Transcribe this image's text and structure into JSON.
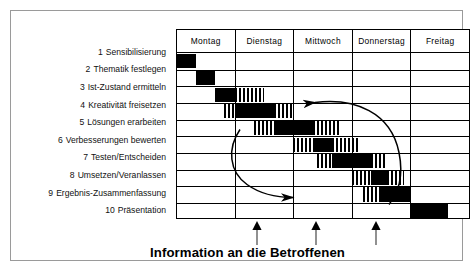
{
  "chart_data": {
    "type": "bar",
    "subtype": "gantt",
    "title": "",
    "xlabel": "",
    "ylabel": "",
    "grid": true,
    "legend": "none",
    "categories": [
      "Montag",
      "Dienstag",
      "Mittwoch",
      "Donnerstag",
      "Freitag"
    ],
    "x_unit": "day",
    "x_range": [
      0,
      5
    ],
    "tasks": [
      {
        "index": 1,
        "number": "1",
        "label": "Sensibilisierung",
        "segments": [
          {
            "style": "solid",
            "start": 0.0,
            "end": 0.33
          }
        ]
      },
      {
        "index": 2,
        "number": "2",
        "label": "Thematik festlegen",
        "segments": [
          {
            "style": "solid",
            "start": 0.33,
            "end": 0.66
          }
        ]
      },
      {
        "index": 3,
        "number": "3",
        "label": "Ist-Zustand ermitteln",
        "segments": [
          {
            "style": "solid",
            "start": 0.66,
            "end": 1.0
          },
          {
            "style": "hatch",
            "start": 1.0,
            "end": 1.5
          }
        ]
      },
      {
        "index": 4,
        "number": "4",
        "label": "Kreativität freisetzen",
        "segments": [
          {
            "style": "hatch",
            "start": 0.8,
            "end": 1.0
          },
          {
            "style": "solid",
            "start": 1.0,
            "end": 1.66
          },
          {
            "style": "hatch",
            "start": 1.66,
            "end": 2.0
          }
        ]
      },
      {
        "index": 5,
        "number": "5",
        "label": "Lösungen erarbeiten",
        "segments": [
          {
            "style": "hatch",
            "start": 1.33,
            "end": 1.66
          },
          {
            "style": "solid",
            "start": 1.66,
            "end": 2.33
          },
          {
            "style": "hatch",
            "start": 2.33,
            "end": 2.8
          }
        ]
      },
      {
        "index": 6,
        "number": "6",
        "label": "Verbesserungen bewerten",
        "segments": [
          {
            "style": "hatch",
            "start": 2.0,
            "end": 2.33
          },
          {
            "style": "solid",
            "start": 2.33,
            "end": 2.66
          },
          {
            "style": "hatch",
            "start": 2.66,
            "end": 3.1
          }
        ]
      },
      {
        "index": 7,
        "number": "7",
        "label": "Testen/Entscheiden",
        "segments": [
          {
            "style": "hatch",
            "start": 2.4,
            "end": 2.66
          },
          {
            "style": "solid",
            "start": 2.66,
            "end": 3.33
          },
          {
            "style": "hatch",
            "start": 3.33,
            "end": 3.6
          }
        ]
      },
      {
        "index": 8,
        "number": "8",
        "label": "Umsetzen/Veranlassen",
        "segments": [
          {
            "style": "hatch",
            "start": 3.0,
            "end": 3.33
          },
          {
            "style": "solid",
            "start": 3.33,
            "end": 3.6
          },
          {
            "style": "hatch",
            "start": 3.6,
            "end": 3.9
          }
        ]
      },
      {
        "index": 9,
        "number": "9",
        "label": "Ergebnis-Zusammenfassung",
        "segments": [
          {
            "style": "hatch",
            "start": 3.2,
            "end": 3.5
          },
          {
            "style": "solid",
            "start": 3.5,
            "end": 4.0
          }
        ]
      },
      {
        "index": 10,
        "number": "10",
        "label": "Präsentation",
        "segments": [
          {
            "style": "solid",
            "start": 4.0,
            "end": 4.66
          }
        ]
      }
    ],
    "feedback_arrows": [
      {
        "name": "arrow-row7-to-row3",
        "from_task": 7,
        "to_task": 3,
        "direction": "left",
        "note": "Rückkopplung von Testen/Entscheiden zu Ist-Zustand ermitteln"
      },
      {
        "name": "arrow-row4-to-row7",
        "from_task": 4,
        "to_task": 7,
        "direction": "right",
        "note": "Rückkopplung von Kreativität freisetzen zu Testen/Entscheiden"
      }
    ],
    "milestone_markers": [
      {
        "label": "",
        "x": 1.38
      },
      {
        "label": "",
        "x": 2.38
      },
      {
        "label": "",
        "x": 3.4
      }
    ],
    "caption": "Information an die Betroffenen",
    "colors": {
      "bar_solid": "#000000",
      "bar_hatch": "#000000",
      "background": "#ffffff",
      "grid_line": "#000000",
      "frame_border": "#9a9a9a",
      "text": "#111111"
    }
  }
}
